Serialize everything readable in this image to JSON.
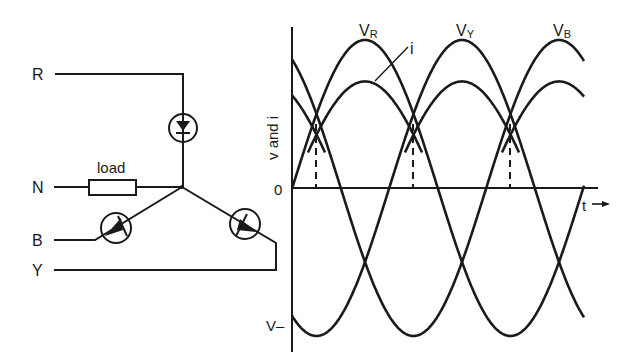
{
  "circuit": {
    "terminals": [
      {
        "label": "R",
        "y": 74
      },
      {
        "label": "N",
        "y": 187
      },
      {
        "label": "B",
        "y": 240
      },
      {
        "label": "Y",
        "y": 269
      }
    ],
    "load_label": "load",
    "diodes": [
      "R-diode",
      "B-diode",
      "Y-diode"
    ]
  },
  "chart_data": {
    "type": "line",
    "title": "",
    "xlabel": "t",
    "ylabel": "v and i",
    "y_ticks": [
      "0",
      "V-"
    ],
    "series": [
      {
        "name": "V_R",
        "label_main": "V",
        "label_sub": "R",
        "kind": "sine",
        "amplitude": 1.0,
        "phase_deg": 0
      },
      {
        "name": "V_Y",
        "label_main": "V",
        "label_sub": "Y",
        "kind": "sine",
        "amplitude": 1.0,
        "phase_deg": -120
      },
      {
        "name": "V_B",
        "label_main": "V",
        "label_sub": "B",
        "kind": "sine",
        "amplitude": 1.0,
        "phase_deg": -240
      },
      {
        "name": "i",
        "label_main": "i",
        "kind": "half-wave-rectified envelope",
        "amplitude": 0.72
      }
    ],
    "annotations": [
      "dashed lines at phase crossover points",
      "t→ arrow on time axis"
    ],
    "grid": false
  },
  "labels": {
    "VR_main": "V",
    "VR_sub": "R",
    "VY_main": "V",
    "VY_sub": "Y",
    "VB_main": "V",
    "VB_sub": "B",
    "i": "i",
    "zero": "0",
    "vminus": "V–",
    "t": "t",
    "ylabel": "v and i"
  }
}
